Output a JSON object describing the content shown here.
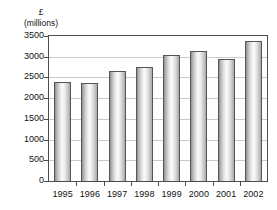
{
  "chart_data": {
    "type": "bar",
    "title": "",
    "subtitle": "",
    "xlabel": "",
    "ylabel": "£ (millions)",
    "ylabel_lines": [
      "£",
      "(millions)"
    ],
    "categories": [
      "1995",
      "1996",
      "1997",
      "1998",
      "1999",
      "2000",
      "2001",
      "2002"
    ],
    "values": [
      2380,
      2375,
      2660,
      2760,
      3030,
      3130,
      2950,
      3390
    ],
    "series": [
      {
        "name": "Annual total",
        "values": [
          2380,
          2375,
          2660,
          2760,
          3030,
          3130,
          2950,
          3390
        ]
      }
    ],
    "ylim": [
      0,
      3500
    ],
    "ytick_values": [
      0,
      500,
      1000,
      1500,
      2000,
      2500,
      3000,
      3500
    ],
    "ytick_labels": [
      "0",
      "500",
      "1000",
      "1500",
      "2000",
      "2500",
      "3000",
      "3500"
    ],
    "grid": true,
    "grid_axis": "y",
    "legend": false,
    "legend_position": "none",
    "bar_style": "gradient-cylinder",
    "colors": {
      "bar_light": "#fbfbfb",
      "bar_mid": "#cfcfcf",
      "bar_dark": "#8f8f8f",
      "bar_outline": "#555555",
      "gridline": "#c9c9c9",
      "axis": "#4d4d4d",
      "text": "#111111",
      "background": "#ffffff"
    }
  },
  "artifacts": {
    "top_clipped_text": "· ·"
  }
}
